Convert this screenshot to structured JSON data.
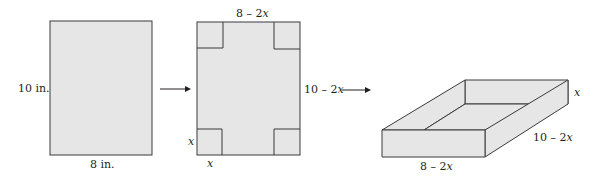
{
  "diagram": {
    "colors": {
      "fill": "#e6e6e6",
      "stroke": "#3a3a3a",
      "text": "#231f20"
    },
    "step1": {
      "height_label": "10 in.",
      "width_label": "8 in."
    },
    "step2": {
      "top_label": "8 – 2",
      "top_var": "x",
      "right_label": "10 – 2",
      "right_var": "x",
      "side_label": "x",
      "bottom_label": "x"
    },
    "step3": {
      "height_label": "x",
      "depth_label": "10 – 2",
      "depth_var": "x",
      "width_label": "8 – 2",
      "width_var": "x"
    }
  }
}
